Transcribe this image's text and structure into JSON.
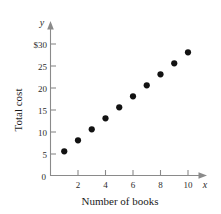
{
  "chart_data": {
    "type": "scatter",
    "title": "",
    "xlabel": "Number of books",
    "ylabel": "Total cost",
    "x_var": "x",
    "y_var": "y",
    "xlim": [
      0,
      11
    ],
    "ylim": [
      0,
      31
    ],
    "grid": false,
    "legend": null,
    "x_ticks": [
      2,
      4,
      6,
      8,
      10
    ],
    "x_tick_labels": [
      "2",
      "4",
      "6",
      "8",
      "10"
    ],
    "y_ticks": [
      5,
      10,
      15,
      20,
      25,
      30
    ],
    "y_tick_labels": [
      "5",
      "10",
      "15",
      "20",
      "25",
      "$30"
    ],
    "origin_label": "0",
    "x": [
      1,
      2,
      3,
      4,
      5,
      6,
      7,
      8,
      9,
      10
    ],
    "values": [
      5.5,
      8,
      10.5,
      13,
      15.5,
      18,
      20.5,
      23,
      25.5,
      28
    ],
    "points": [
      {
        "x": 1,
        "y": 5.5
      },
      {
        "x": 2,
        "y": 8
      },
      {
        "x": 3,
        "y": 10.5
      },
      {
        "x": 4,
        "y": 13
      },
      {
        "x": 5,
        "y": 15.5
      },
      {
        "x": 6,
        "y": 18
      },
      {
        "x": 7,
        "y": 20.5
      },
      {
        "x": 8,
        "y": 23
      },
      {
        "x": 9,
        "y": 25.5
      },
      {
        "x": 10,
        "y": 28
      }
    ],
    "marker_color": "#121212",
    "axis_color": "#8a8a8a"
  }
}
